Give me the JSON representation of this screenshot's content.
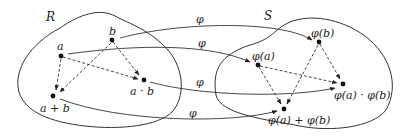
{
  "diagram": {
    "sets": {
      "domain": {
        "label": "R"
      },
      "codomain": {
        "label": "S"
      }
    },
    "domain_points": {
      "a": "a",
      "b": "b",
      "product": "a · b",
      "sum": "a + b"
    },
    "codomain_points": {
      "phi_a": "φ(a)",
      "phi_b": "φ(b)",
      "product": "φ(a) · φ(b)",
      "sum": "φ(a) + φ(b)"
    },
    "map_label": "φ",
    "maps": [
      {
        "from": "b",
        "to": "φ(b)",
        "label": "φ"
      },
      {
        "from": "a",
        "to": "φ(a)",
        "label": "φ"
      },
      {
        "from": "a · b",
        "to": "φ(a) · φ(b)",
        "label": "φ"
      },
      {
        "from": "a + b",
        "to": "φ(a) + φ(b)",
        "label": "φ"
      }
    ]
  }
}
